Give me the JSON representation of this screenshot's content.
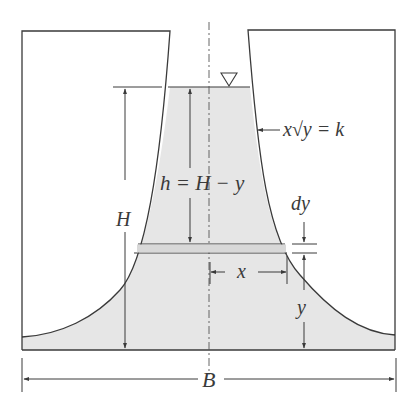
{
  "figure": {
    "top_caption_fragment": "g   pp",
    "labels": {
      "curve_equation": "x√y = k",
      "curve_eq_x": "x",
      "curve_eq_y": "y",
      "curve_eq_rhs": "= k",
      "h_relation": "h = H − y",
      "H": "H",
      "dy": "dy",
      "x": "x",
      "y": "y",
      "B": "B"
    },
    "colors": {
      "line": "#3a3a3a",
      "water_fill": "#e6e6e6",
      "background": "#ffffff"
    }
  }
}
